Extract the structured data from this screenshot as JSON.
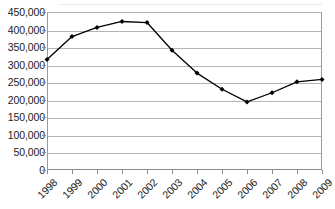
{
  "chart_data": {
    "type": "line",
    "title": "",
    "subtitle": "",
    "xlabel": "",
    "ylabel": "",
    "categories": [
      "1998",
      "1999",
      "2000",
      "2001",
      "2002",
      "2003",
      "2004",
      "2005",
      "2006",
      "2007",
      "2008",
      "2009"
    ],
    "values": [
      315000,
      380000,
      406000,
      423000,
      420000,
      341000,
      276000,
      230000,
      194000,
      220000,
      251000,
      258000
    ],
    "series": [
      {
        "name": "",
        "values": [
          315000,
          380000,
          406000,
          423000,
          420000,
          341000,
          276000,
          230000,
          194000,
          220000,
          251000,
          258000
        ]
      }
    ],
    "ylim": [
      0,
      450000
    ],
    "ytick_values": [
      0,
      50000,
      100000,
      150000,
      200000,
      250000,
      300000,
      350000,
      400000,
      450000
    ],
    "ytick_labels": [
      "0",
      "50,000",
      "100,000",
      "150,000",
      "200,000",
      "250,000",
      "300,000",
      "350,000",
      "400,000",
      "450,000"
    ],
    "xtick_labels": [
      "1998",
      "1999",
      "2000",
      "2001",
      "2002",
      "2003",
      "2004",
      "2005",
      "2006",
      "2007",
      "2008",
      "2009"
    ],
    "xtick_rotation": -45,
    "grid": "horizontal",
    "legend": "none",
    "marker": "diamond",
    "line_color": "#000000",
    "marker_color": "#000000",
    "gridline_color": "#b4b4b4",
    "axis_color": "#8c8c8c",
    "text_color": "#1b1b1b",
    "background_color": "#ffffff",
    "annotations": []
  }
}
